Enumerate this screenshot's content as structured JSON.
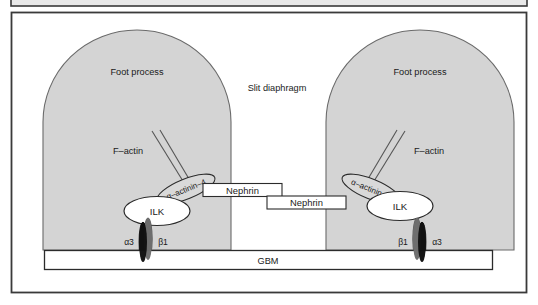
{
  "figure": {
    "title_partial_strip": "",
    "outer_frame": {
      "border_color": "#3a3a3a",
      "fill": "#ffffff"
    },
    "colors": {
      "foot_process_fill": "#d4d4d4",
      "foot_process_stroke": "#6a6a6a",
      "ellipse_white_fill": "#ffffff",
      "ellipse_stroke": "#2b2b2b",
      "actinin_fill": "#d9d9d9",
      "integrin_alpha3_fill": "#6e6e6e",
      "integrin_beta1_fill": "#111111",
      "box_fill": "#ffffff",
      "box_stroke": "#2b2b2b",
      "top_strip_fill": "#e8e8e8",
      "text_color": "#1a1a1a",
      "actin_line_color": "#555555"
    },
    "labels": {
      "foot_process_left": "Foot process",
      "foot_process_right": "Foot process",
      "slit_diaphragm": "Slit diaphragm",
      "f_actin_left": "F–actin",
      "f_actin_right": "F–actin",
      "alpha_actinin_left": "α–actinin–4",
      "alpha_actinin_right": "α–actinin–4",
      "ilk_left": "ILK",
      "ilk_right": "ILK",
      "nephrin_upper": "Nephrin",
      "nephrin_lower": "Nephrin",
      "gbm": "GBM",
      "integrin_left_alpha": "α3",
      "integrin_left_beta": "β1",
      "integrin_right_beta": "β1",
      "integrin_right_alpha": "α3"
    }
  }
}
